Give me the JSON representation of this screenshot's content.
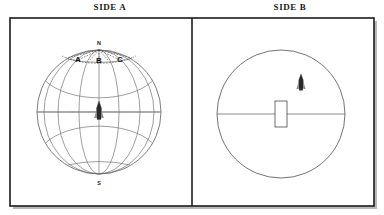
{
  "figure": {
    "panels": [
      {
        "id": "side-a",
        "title": "SIDE A",
        "view": "globe-wireframe",
        "pole_labels": {
          "north": "N",
          "south": "S"
        },
        "marked_points": [
          {
            "label": "A"
          },
          {
            "label": "B"
          },
          {
            "label": "C"
          }
        ],
        "objects": [
          {
            "name": "spacecraft",
            "position": "equator-center"
          }
        ],
        "grid": {
          "parallels": 5,
          "meridians": 7,
          "dashed_polar_arc": true
        }
      },
      {
        "id": "side-b",
        "title": "SIDE B",
        "view": "circle-plain",
        "objects": [
          {
            "name": "slot-rectangle",
            "position": "center"
          },
          {
            "name": "spacecraft",
            "position": "upper-right-quadrant"
          }
        ],
        "diameter_line": true
      }
    ],
    "colors": {
      "frame": "#1c1c1c",
      "grid": "#6a6a6a",
      "outline": "#5a5a5a",
      "label": "#111111",
      "craft": "#2a2a2a",
      "background": "#ffffff"
    }
  }
}
